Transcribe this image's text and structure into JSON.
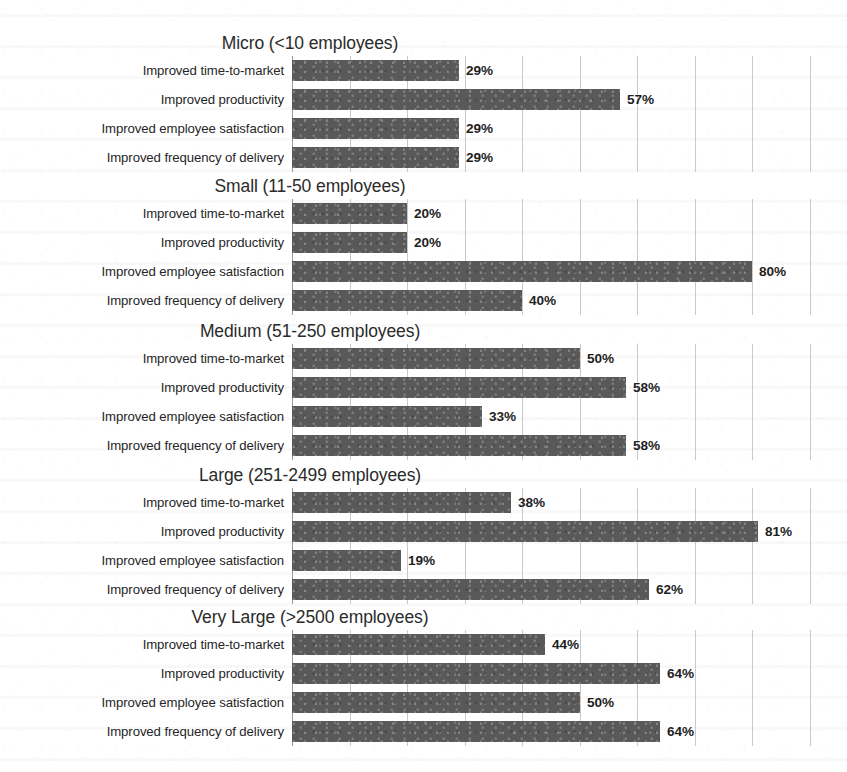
{
  "chart_data": {
    "type": "bar",
    "orientation": "horizontal",
    "title": "",
    "xlabel": "",
    "ylabel": "",
    "xlim": [
      0,
      100
    ],
    "value_suffix": "%",
    "grid": true,
    "grid_axis": "x",
    "grid_step": 10,
    "legend": "none",
    "bar_color": "#595959",
    "categories": [
      "Improved time-to-market",
      "Improved productivity",
      "Improved employee satisfaction",
      "Improved frequency of delivery"
    ],
    "panels": [
      {
        "title": "Micro (<10 employees)",
        "values": [
          29,
          57,
          29,
          29
        ],
        "labels": [
          "29%",
          "57%",
          "29%",
          "29%"
        ]
      },
      {
        "title": "Small (11-50 employees)",
        "values": [
          20,
          20,
          80,
          40
        ],
        "labels": [
          "20%",
          "20%",
          "80%",
          "40%"
        ]
      },
      {
        "title": "Medium (51-250 employees)",
        "values": [
          50,
          58,
          33,
          58
        ],
        "labels": [
          "50%",
          "58%",
          "33%",
          "58%"
        ]
      },
      {
        "title": "Large (251-2499 employees)",
        "values": [
          38,
          81,
          19,
          62
        ],
        "labels": [
          "38%",
          "81%",
          "19%",
          "62%"
        ]
      },
      {
        "title": "Very Large (>2500 employees)",
        "values": [
          44,
          64,
          50,
          64
        ],
        "labels": [
          "44%",
          "64%",
          "50%",
          "64%"
        ]
      }
    ]
  }
}
